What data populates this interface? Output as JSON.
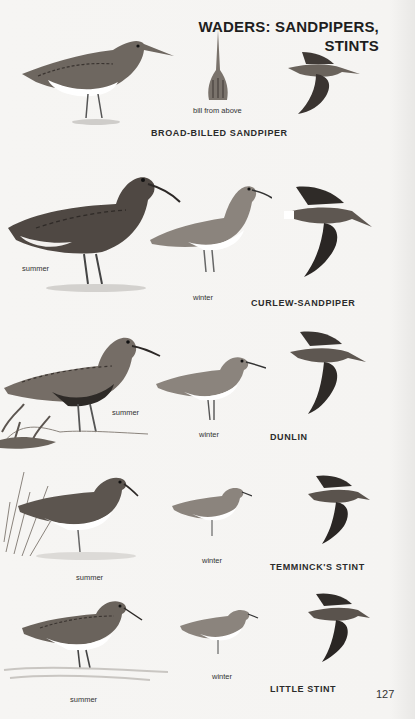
{
  "header": {
    "title_line1": "WADERS: SANDPIPERS,",
    "title_line2": "STINTS"
  },
  "page_number": "127",
  "species": [
    {
      "name": "BROAD-BILLED SANDPIPER",
      "captions": {
        "bill": "bill from above"
      },
      "illustrations": [
        "standing-bird",
        "bill-from-above",
        "flying-bird"
      ]
    },
    {
      "name": "CURLEW-SANDPIPER",
      "captions": {
        "summer": "summer",
        "winter": "winter"
      },
      "illustrations": [
        "summer-standing-bird",
        "winter-standing-bird",
        "flying-bird"
      ]
    },
    {
      "name": "DUNLIN",
      "captions": {
        "summer": "summer",
        "winter": "winter"
      },
      "illustrations": [
        "summer-standing-bird",
        "winter-standing-bird",
        "flying-bird"
      ]
    },
    {
      "name": "TEMMINCK'S STINT",
      "captions": {
        "summer": "summer",
        "winter": "winter"
      },
      "illustrations": [
        "summer-standing-bird",
        "winter-standing-bird",
        "flying-bird"
      ]
    },
    {
      "name": "LITTLE STINT",
      "captions": {
        "summer": "summer",
        "winter": "winter"
      },
      "illustrations": [
        "summer-standing-bird",
        "winter-standing-bird",
        "flying-bird"
      ]
    }
  ],
  "colors": {
    "paper": "#f5f4f2",
    "ink_dark": "#2a2a2a",
    "bird_dark": "#4a4440",
    "bird_mid": "#8a827a",
    "bird_belly": "#ffffff"
  }
}
